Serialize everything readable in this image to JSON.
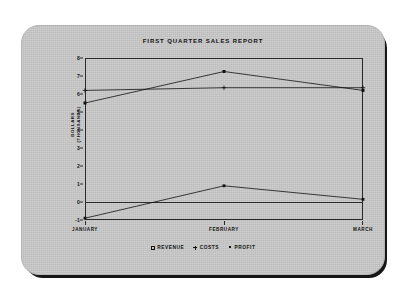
{
  "card": {
    "background_color": "#c9c9c9",
    "shadow_color": "#161616"
  },
  "chart_data": {
    "type": "line",
    "title": "FIRST QUARTER SALES REPORT",
    "xlabel": "",
    "ylabel": "DOLLARS",
    "ylabel_line2": "(THOUSANDS)",
    "categories": [
      "JANUARY",
      "FEBRUARY",
      "MARCH"
    ],
    "ylim": [
      -1,
      8
    ],
    "yticks": [
      -1,
      0,
      1,
      2,
      3,
      4,
      5,
      6,
      7,
      8
    ],
    "ytick_labels": [
      "-1",
      "0",
      "1",
      "2",
      "3",
      "4",
      "5",
      "6",
      "7",
      "8"
    ],
    "grid": false,
    "legend_position": "bottom",
    "series": [
      {
        "name": "REVENUE",
        "marker": "square",
        "color": "#111111",
        "values": [
          5.5,
          7.25,
          6.2
        ]
      },
      {
        "name": "COSTS",
        "marker": "plus",
        "color": "#111111",
        "values": [
          6.2,
          6.35,
          6.35
        ]
      },
      {
        "name": "PROFIT",
        "marker": "dot",
        "color": "#111111",
        "values": [
          -0.9,
          0.9,
          0.15
        ]
      }
    ]
  }
}
